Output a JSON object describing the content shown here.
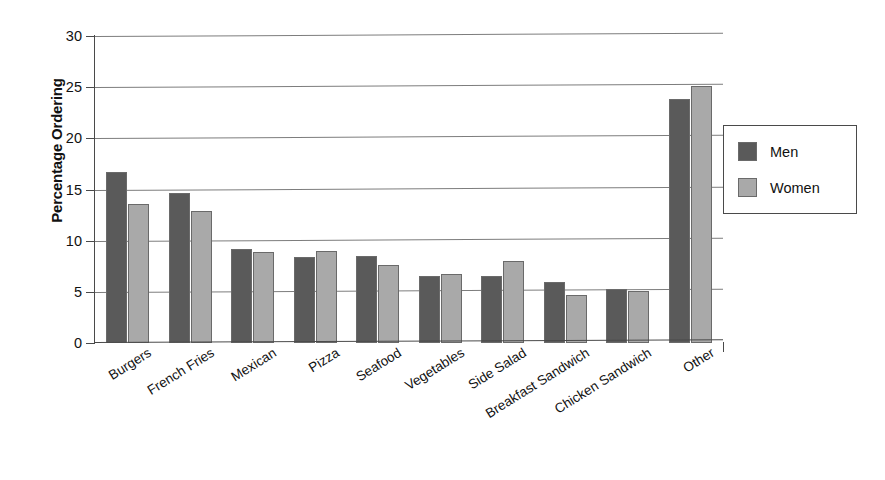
{
  "chart_data": {
    "type": "bar",
    "title": "",
    "subtitle": "",
    "xlabel": "",
    "ylabel": "Percentage Ordering",
    "ylim": [
      0,
      30
    ],
    "yticks": [
      0,
      5,
      10,
      15,
      20,
      25,
      30
    ],
    "ytick_labels": [
      "0",
      "5",
      "10",
      "15",
      "20",
      "25",
      "30"
    ],
    "grid": true,
    "grid_axis": "y",
    "legend_position": "right",
    "orientation": "vertical",
    "categories": [
      "Burgers",
      "French Fries",
      "Mexican",
      "Pizza",
      "Seafood",
      "Vegetables",
      "Side Salad",
      "Breakfast Sandwich",
      "Chicken Sandwich",
      "Other"
    ],
    "series": [
      {
        "name": "Men",
        "color": "#5a5a5a",
        "values": [
          16.7,
          14.7,
          9.2,
          8.4,
          8.5,
          6.5,
          6.5,
          6.0,
          5.3,
          23.8
        ]
      },
      {
        "name": "Women",
        "color": "#a9a9a9",
        "values": [
          13.6,
          12.9,
          8.9,
          9.0,
          7.6,
          6.7,
          8.0,
          4.7,
          5.1,
          25.1
        ]
      }
    ]
  },
  "legend": {
    "entries": [
      {
        "label": "Men",
        "color": "#5a5a5a"
      },
      {
        "label": "Women",
        "color": "#a9a9a9"
      }
    ]
  },
  "axes": {
    "y_title": "Percentage Ordering"
  },
  "colors": {
    "men_fill": "#5a5a5a",
    "women_fill": "#a9a9a9",
    "axis_line": "#4a4a4a",
    "gridline": "#7d7d7d",
    "background": "#ffffff"
  }
}
